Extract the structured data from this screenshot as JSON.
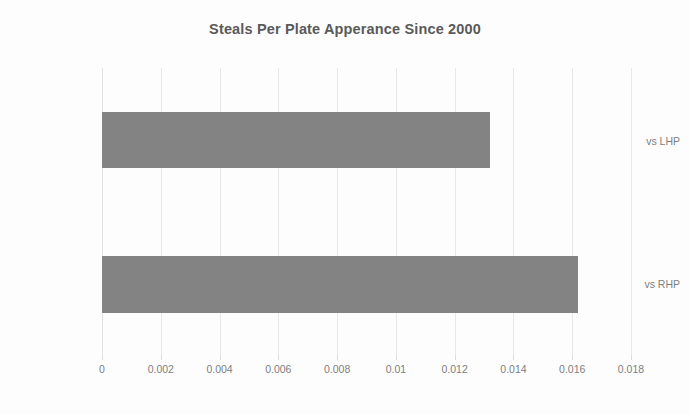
{
  "chart_data": {
    "type": "bar",
    "orientation": "horizontal",
    "title": "Steals Per Plate Apperance Since 2000",
    "xlabel": "",
    "ylabel": "",
    "categories": [
      "vs LHP",
      "vs RHP"
    ],
    "values": [
      0.0132,
      0.0162
    ],
    "xlim": [
      0,
      0.018
    ],
    "xticks": [
      0,
      0.002,
      0.004,
      0.006,
      0.008,
      0.01,
      0.012,
      0.014,
      0.016,
      0.018
    ],
    "xtick_labels": [
      "0",
      "0.002",
      "0.004",
      "0.006",
      "0.008",
      "0.01",
      "0.012",
      "0.014",
      "0.016",
      "0.018"
    ],
    "grid": true,
    "grid_axis": "x",
    "legend": false,
    "legend_position": "none",
    "series": [
      {
        "name": "Steals Per Plate Appearance",
        "values": [
          0.0132,
          0.0162
        ]
      }
    ]
  },
  "colors": {
    "bar_fill": "#838383",
    "title_text": "#5a5a5a",
    "tick_text": "#7d7d7d",
    "gridline": "#e9e9e9",
    "background": "#ffffff"
  }
}
